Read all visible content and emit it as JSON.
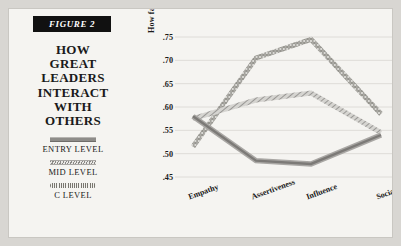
{
  "figure": {
    "badge": "FIGURE 2",
    "headline_lines": [
      "HOW",
      "GREAT",
      "LEADERS",
      "INTERACT",
      "WITH",
      "OTHERS"
    ],
    "headline": "HOW GREAT LEADERS INTERACT WITH OTHERS"
  },
  "legend": {
    "position": "left-panel",
    "items": [
      {
        "label": "ENTRY LEVEL",
        "style": "solid-bar",
        "color": "#8e8c89"
      },
      {
        "label": "MID LEVEL",
        "style": "hatched-bar",
        "color": "#8a8885"
      },
      {
        "label": "C LEVEL",
        "style": "dotted-chain",
        "color": "#78766f"
      }
    ]
  },
  "colors": {
    "background": "#d8d6d2",
    "card": "#f5f4f1",
    "ink": "#1a1a1a",
    "badge_bg": "#111111",
    "badge_fg": "#ffffff",
    "grid": "#dedcd8",
    "entry": "#8e8c89",
    "mid": "#8a8885",
    "clevel": "#78766f"
  },
  "axis": {
    "y_ticks": [
      ".75",
      ".70",
      ".65",
      ".60",
      ".55",
      ".50",
      ".45"
    ],
    "y_tick_values": [
      0.75,
      0.7,
      0.65,
      0.6,
      0.55,
      0.5,
      0.45
    ]
  },
  "chart_data": {
    "type": "line",
    "title": "HOW GREAT LEADERS INTERACT WITH OTHERS",
    "subtitle": "FIGURE 2",
    "xlabel": "",
    "ylabel": "How far above/below the norm (.05)",
    "categories": [
      "Empathy",
      "Assertiveness",
      "Influence",
      "Sociability"
    ],
    "ylim": [
      0.45,
      0.75
    ],
    "ytick_labels": [
      ".45",
      ".50",
      ".55",
      ".60",
      ".65",
      ".70",
      ".75"
    ],
    "grid": true,
    "legend_position": "left",
    "series": [
      {
        "name": "ENTRY LEVEL",
        "style": "solid",
        "color": "#8e8c89",
        "values": [
          0.58,
          0.485,
          0.478,
          0.54
        ]
      },
      {
        "name": "MID LEVEL",
        "style": "hatched",
        "color": "#8a8885",
        "values": [
          0.575,
          0.615,
          0.63,
          0.545
        ]
      },
      {
        "name": "C LEVEL",
        "style": "dotted",
        "color": "#78766f",
        "values": [
          0.515,
          0.705,
          0.745,
          0.585
        ]
      }
    ]
  }
}
